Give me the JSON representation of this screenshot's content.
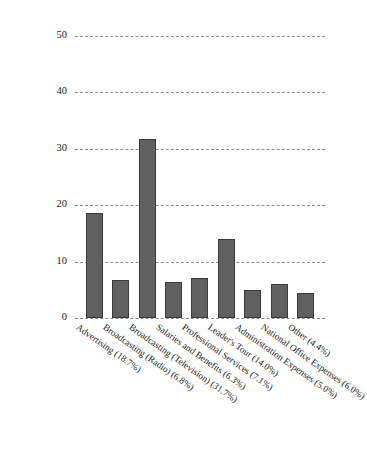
{
  "chart_data": {
    "type": "bar",
    "title": "",
    "subtitle": "",
    "xlabel": "",
    "ylabel": "",
    "ylim": [
      0,
      50
    ],
    "yticks": [
      0,
      10,
      20,
      30,
      40,
      50
    ],
    "grid": true,
    "legend": null,
    "categories": [
      "Advertising (18.7%)",
      "Broadcasting (Radio) (6.8%)",
      "Broadcasting (Television) (31.7%)",
      "Salaries and Benefits (6.3%)",
      "Professional Services (7.1%)",
      "Leader's Tour (14.0%)",
      "Administration Expenses (5.0%)",
      "National Office Expenses (6.0%)",
      "Other (4.4%)"
    ],
    "values": [
      18.7,
      6.8,
      31.7,
      6.3,
      7.1,
      14.0,
      5.0,
      6.0,
      4.4
    ],
    "bar_color": "#606060",
    "bar_edge_color": "#3a3a3a",
    "gridline_color": "#8e8e8e",
    "gridline_style": "dashed",
    "background_color": "#ffffff"
  }
}
